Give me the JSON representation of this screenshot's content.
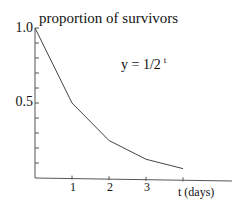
{
  "chart_data": {
    "type": "line",
    "title": "proportion of survivors",
    "annotation": "y = 1/2 t",
    "formula": {
      "base": "y = 1/2",
      "exponent": "t"
    },
    "xlabel": "t (days)",
    "ylabel": "proportion of survivors",
    "x": [
      0,
      1,
      2,
      3,
      4
    ],
    "values": [
      1.0,
      0.5,
      0.25,
      0.125,
      0.0625
    ],
    "series": [
      {
        "name": "y = 1/2^t",
        "values": [
          1.0,
          0.5,
          0.25,
          0.125,
          0.0625
        ]
      }
    ],
    "x_tick_labels": [
      "1",
      "2",
      "3"
    ],
    "x_ticks": [
      1,
      2,
      3,
      4
    ],
    "y_tick_labels": [
      "1.0",
      "0.5"
    ],
    "y_ticks": [
      0.1,
      0.2,
      0.3,
      0.4,
      0.5,
      0.6,
      0.7,
      0.8,
      0.9,
      1.0
    ],
    "xlim": [
      0,
      5.5
    ],
    "ylim": [
      0,
      1.0
    ],
    "grid": false,
    "legend": "none"
  },
  "labels": {
    "title": "proportion of survivors",
    "formula_base": "y = 1/2",
    "formula_exp": "t",
    "xlabel": "t (days)",
    "y_top": "1.0",
    "y_mid": "0.5",
    "x1": "1",
    "x2": "2",
    "x3": "3"
  }
}
